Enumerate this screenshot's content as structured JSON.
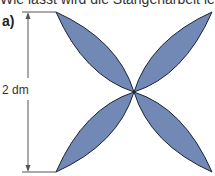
{
  "header": {
    "partial_text": "Wie lässt wird die Stangenarbeit legen"
  },
  "figure": {
    "part_label": "a)",
    "dimension_label": "2 dm",
    "fill_color": "#7189b4",
    "stroke_color": "#1a2233",
    "shape": "four-petal",
    "square": {
      "left": 56,
      "top": 12,
      "right": 212,
      "bottom": 172
    }
  }
}
